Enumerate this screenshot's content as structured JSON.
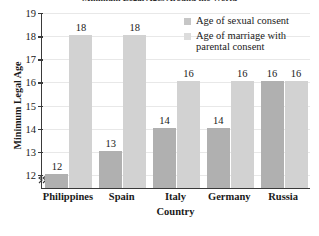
{
  "chart_data": {
    "type": "bar",
    "title": "Minimum Legal Ages Around the World",
    "xlabel": "Country",
    "ylabel": "Minimum Legal Age",
    "categories": [
      "Philippines",
      "Spain",
      "Italy",
      "Germany",
      "Russia"
    ],
    "series": [
      {
        "name": "Age of sexual consent",
        "color": "#b0b0b0",
        "values": [
          12,
          13,
          14,
          14,
          16
        ]
      },
      {
        "name": "Age of marriage with parental consent",
        "color": "#d2d2d2",
        "values": [
          18,
          18,
          16,
          16,
          16
        ]
      }
    ],
    "ylim": [
      11.4,
      19
    ],
    "yticks": [
      12,
      13,
      14,
      15,
      16,
      17,
      18,
      19
    ],
    "ytick_labels": [
      "12",
      "13",
      "14",
      "15",
      "16",
      "17",
      "18",
      "19"
    ],
    "grid": true,
    "axis_break": true,
    "legend_position": "top-right",
    "data_labels": true
  },
  "legend": {
    "entries": [
      {
        "label": "Age of sexual consent"
      },
      {
        "label": "Age of marriage with parental consent"
      }
    ]
  }
}
